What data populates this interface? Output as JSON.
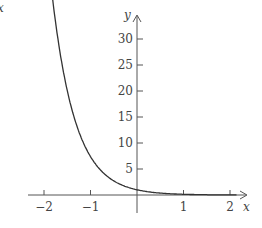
{
  "chart_data": {
    "type": "line",
    "title": "",
    "function": "y = e^(-2x)",
    "xlabel": "x",
    "ylabel": "y",
    "xlim": [
      -2.3,
      2.3
    ],
    "ylim": [
      0,
      33
    ],
    "x_ticks": [
      -2,
      -1,
      1,
      2
    ],
    "x_tick_labels": [
      "−2",
      "−1",
      "1",
      "2"
    ],
    "y_ticks": [
      5,
      10,
      15,
      20,
      25,
      30
    ],
    "y_tick_labels": [
      "5",
      "10",
      "15",
      "20",
      "25",
      "30"
    ],
    "grid": false,
    "legend": null,
    "series": [
      {
        "name": "curve",
        "x": [
          -1.75,
          -1.5,
          -1.25,
          -1.0,
          -0.75,
          -0.5,
          -0.25,
          0,
          0.25,
          0.5,
          0.75,
          1.0,
          1.5,
          2.0
        ],
        "y": [
          33.1,
          20.1,
          12.2,
          7.39,
          4.48,
          2.72,
          1.65,
          1.0,
          0.61,
          0.37,
          0.22,
          0.14,
          0.05,
          0.02
        ]
      }
    ],
    "corner_mark": "x"
  }
}
